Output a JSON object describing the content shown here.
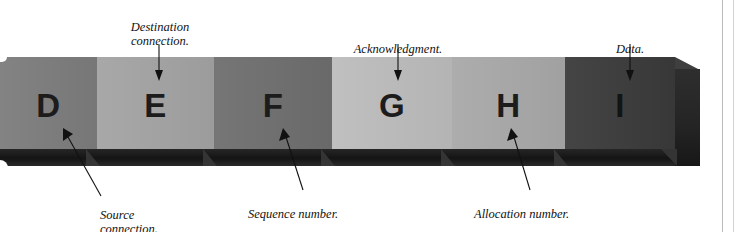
{
  "figure": {
    "type": "labeled-3d-bar-diagram",
    "bar": {
      "segments": [
        {
          "letter": "D",
          "field": "Source connection.",
          "color": "#7c7c7c",
          "x": 0,
          "width": 97
        },
        {
          "letter": "E",
          "field": "Destination connection.",
          "color": "#a3a3a3",
          "x": 97,
          "width": 117
        },
        {
          "letter": "F",
          "field": "Sequence number.",
          "color": "#6e6e6e",
          "x": 214,
          "width": 118
        },
        {
          "letter": "G",
          "field": "Acknowledgment.",
          "color": "#bcbcbc",
          "x": 332,
          "width": 120
        },
        {
          "letter": "H",
          "field": "Allocation number.",
          "color": "#a8a8a8",
          "x": 452,
          "width": 113
        },
        {
          "letter": "I",
          "field": "Data.",
          "color": "#3a3a3a",
          "x": 565,
          "width": 110
        }
      ],
      "bottom_face_color": "#1a1a1a",
      "end_cap_color": "#262626"
    },
    "callouts_top": [
      {
        "id": "destination",
        "text": "Destination\nconnection.",
        "target_letter": "E"
      },
      {
        "id": "acknowledgment",
        "text": "Acknowledgment.",
        "target_letter": "G"
      },
      {
        "id": "data",
        "text": "Data.",
        "target_letter": "I"
      }
    ],
    "callouts_bottom": [
      {
        "id": "source",
        "text": "Source\nconnection.",
        "target_letter": "D"
      },
      {
        "id": "sequence",
        "text": "Sequence number.",
        "target_letter": "F"
      },
      {
        "id": "allocation",
        "text": "Allocation number.",
        "target_letter": "H"
      }
    ],
    "background_color": "#ffffff",
    "text_color": "#111111"
  }
}
